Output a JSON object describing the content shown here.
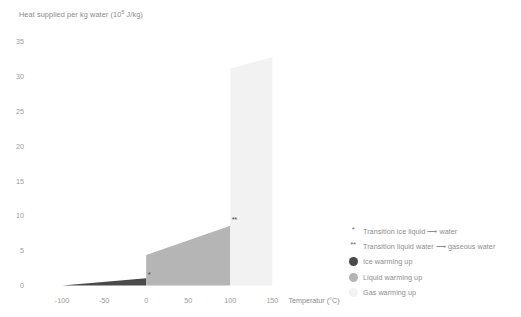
{
  "chart_data": {
    "type": "area",
    "title": "",
    "ylabel": "Heat supplied per kg water (10⁵ J/kg)",
    "ylabel_base": "Heat supplied per kg water (10",
    "ylabel_exp": "5",
    "ylabel_tail": " J/kg)",
    "xlabel": "Temperatur (°C)",
    "xticks": [
      -100,
      -50,
      0,
      50,
      100,
      150
    ],
    "xtick_labels": [
      "-100",
      "-50",
      "0",
      "50",
      "100",
      "150"
    ],
    "yticks": [
      0,
      5,
      10,
      15,
      20,
      25,
      30,
      35
    ],
    "ytick_labels": [
      "0",
      "5",
      "10",
      "15",
      "20",
      "25",
      "30",
      "35"
    ],
    "xlim": [
      -125,
      165
    ],
    "ylim": [
      0,
      36.5
    ],
    "grid": false,
    "legend_position": "right",
    "segments": [
      {
        "name": "Ice warming up",
        "phase": "ice",
        "x_start": -100,
        "x_end": 0,
        "y_start": 0,
        "y_end": 1.05,
        "color": "#4a4a4a"
      },
      {
        "name": "Liquid warming up",
        "phase": "liquid",
        "x_start": 0,
        "x_end": 100,
        "y_start": 4.4,
        "y_end": 8.6,
        "color": "#b5b5b5"
      },
      {
        "name": "Gas warming up",
        "phase": "gas",
        "x_start": 100,
        "x_end": 150,
        "y_start": 31.2,
        "y_end": 32.8,
        "color": "#f2f2f2"
      }
    ],
    "transitions": [
      {
        "name": "Transition ice liquid ⟶ water",
        "marker": "*",
        "x": 0,
        "y_start": 1.05,
        "y_end": 4.4
      },
      {
        "name": "Transition liquid water ⟶ gaseous water",
        "marker": "**",
        "x": 100,
        "y_start": 8.6,
        "y_end": 31.2
      }
    ],
    "annotations": [
      {
        "marker": "*",
        "x": 0,
        "y": 1.6
      },
      {
        "marker": "**",
        "x": 100,
        "y": 9.6
      }
    ]
  },
  "legend": {
    "items": [
      {
        "marker": "*",
        "type": "asterisk",
        "label": "Transition ice liquid ⟶ water",
        "color": "#6f6f6f"
      },
      {
        "marker": "**",
        "type": "asterisk",
        "label": "Transition liquid water ⟶ gaseous water",
        "color": "#6f6f6f"
      },
      {
        "marker": "",
        "type": "dot",
        "label": "Ice warming up",
        "color": "#4a4a4a"
      },
      {
        "marker": "",
        "type": "dot",
        "label": "Liquid warming up",
        "color": "#b5b5b5"
      },
      {
        "marker": "",
        "type": "dot",
        "label": "Gas warming up",
        "color": "#f2f2f2"
      }
    ]
  },
  "colors": {
    "ice": "#4a4a4a",
    "liquid": "#b5b5b5",
    "gas": "#f2f2f2",
    "tick_text": "#9a9a9a",
    "axis_title": "#8a8a8a",
    "legend_text": "#8e8e8e",
    "background": "#ffffff"
  }
}
